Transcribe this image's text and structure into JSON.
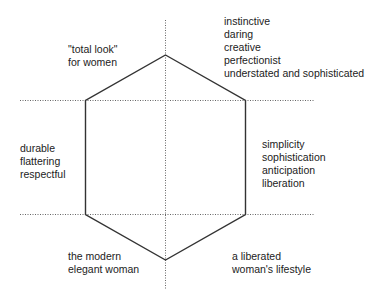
{
  "diagram": {
    "type": "hexagon-quadrant",
    "colors": {
      "hexagon_stroke": "#333333",
      "guide_lines": "#666666",
      "text": "#222222"
    },
    "labels": {
      "top_left": [
        "\"total look\"",
        "for women"
      ],
      "top_right": [
        "instinctive",
        "daring",
        "creative",
        "perfectionist",
        "understated and sophisticated"
      ],
      "middle_left": [
        "durable",
        "flattering",
        "respectful"
      ],
      "middle_right": [
        "simplicity",
        "sophistication",
        "anticipation",
        "liberation"
      ],
      "bottom_left": [
        "the modern",
        "elegant woman"
      ],
      "bottom_right": [
        "a liberated",
        "woman's lifestyle"
      ]
    }
  }
}
